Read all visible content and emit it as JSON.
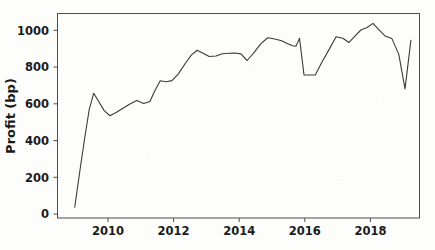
{
  "chart_data": {
    "type": "line",
    "title": "",
    "subtitle": "",
    "xlabel": "",
    "ylabel": "Profit (bp)",
    "xlim": [
      2008.8,
      2019.3
    ],
    "ylim": [
      -60,
      1080
    ],
    "xticks": [
      2010,
      2012,
      2014,
      2016,
      2018
    ],
    "xticklabels": [
      "2010",
      "2012",
      "2014",
      "2016",
      "2018"
    ],
    "yticks": [
      0,
      200,
      400,
      600,
      800,
      1000
    ],
    "yticklabels": [
      "0",
      "200",
      "400",
      "600",
      "800",
      "1000"
    ],
    "grid": false,
    "legend": null,
    "legend_position": "none",
    "line_color": "#3a3a3a",
    "line_width": 1.1,
    "series": [
      {
        "name": "Profit (bp)",
        "x": [
          2009.3,
          2009.45,
          2009.6,
          2009.72,
          2009.85,
          2010.0,
          2010.15,
          2010.32,
          2010.5,
          2010.7,
          2010.9,
          2011.1,
          2011.3,
          2011.48,
          2011.62,
          2011.78,
          2011.95,
          2012.12,
          2012.3,
          2012.5,
          2012.68,
          2012.85,
          2013.02,
          2013.2,
          2013.4,
          2013.58,
          2013.78,
          2013.95,
          2014.12,
          2014.3,
          2014.5,
          2014.7,
          2014.9,
          2015.1,
          2015.3,
          2015.48,
          2015.62,
          2015.72,
          2015.82,
          2015.95,
          2016.1,
          2016.28,
          2016.48,
          2016.68,
          2016.88,
          2017.08,
          2017.25,
          2017.42,
          2017.6,
          2017.78,
          2017.95,
          2018.12,
          2018.3,
          2018.5,
          2018.7,
          2018.88,
          2019.05
        ],
        "y": [
          0,
          205,
          400,
          545,
          635,
          588,
          540,
          510,
          528,
          552,
          575,
          595,
          578,
          590,
          648,
          705,
          700,
          706,
          742,
          800,
          848,
          875,
          858,
          840,
          843,
          856,
          858,
          860,
          855,
          818,
          862,
          912,
          945,
          938,
          928,
          912,
          900,
          898,
          942,
          738,
          737,
          738,
          812,
          880,
          950,
          942,
          918,
          952,
          988,
          1002,
          1025,
          990,
          955,
          940,
          852,
          660,
          930
        ]
      }
    ]
  },
  "axes": {
    "ylabel": "Profit (bp)",
    "ytick_labels": [
      "1000",
      "800",
      "600",
      "400",
      "200",
      "0"
    ],
    "xtick_labels": [
      "2010",
      "2012",
      "2014",
      "2016",
      "2018"
    ]
  }
}
